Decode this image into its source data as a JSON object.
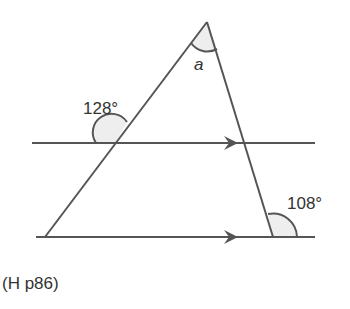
{
  "diagram": {
    "type": "geometry-parallel-lines-triangle",
    "apex_label": "a",
    "angle_left_label": "128°",
    "angle_right_label": "108°",
    "parallel_marks": "arrows",
    "colors": {
      "line": "#555555",
      "arc_fill": "#eeeeee",
      "text": "#333333"
    }
  },
  "caption": "(H p86)"
}
